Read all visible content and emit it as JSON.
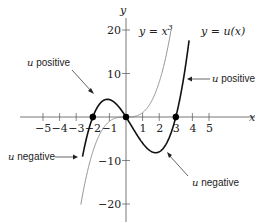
{
  "chart_data": {
    "type": "line",
    "title": "",
    "xlabel": "x",
    "ylabel": "y",
    "xlim": [
      -5.6,
      5.8
    ],
    "ylim": [
      -22,
      24
    ],
    "x_ticks": [
      -5,
      -4,
      -3,
      -2,
      -1,
      1,
      2,
      3,
      4,
      5
    ],
    "y_ticks": [
      20,
      10,
      -10,
      -20
    ],
    "x_tick_labels": [
      "−5",
      "−4",
      "−3",
      "−2",
      "−1",
      "1",
      "2",
      "3",
      "4",
      "5"
    ],
    "y_tick_labels": [
      "20",
      "10",
      "−10",
      "−20"
    ],
    "grid": false,
    "series": [
      {
        "name": "y = x^3",
        "label": "y = x³",
        "function": "x^3",
        "style": "thin gray",
        "x": [
          -2.8,
          -2,
          -1,
          0,
          1,
          2,
          2.8
        ],
        "values": [
          -21.95,
          -8,
          -1,
          0,
          1,
          8,
          21.95
        ]
      },
      {
        "name": "y = u(x)",
        "label": "y = u(x)",
        "function": "x(x+2)(x-3)",
        "style": "thick black",
        "x": [
          -2.5,
          -2,
          -1,
          0,
          1,
          2,
          3,
          3.5,
          4
        ],
        "values": [
          -6.875,
          0,
          4,
          0,
          -6,
          -8,
          0,
          9.625,
          24
        ]
      }
    ],
    "points": [
      {
        "x": -2,
        "y": 0
      },
      {
        "x": 0,
        "y": 0
      },
      {
        "x": 3,
        "y": 0
      }
    ],
    "annotations": [
      {
        "text": "u positive",
        "points_to": "hump between -2 and 0"
      },
      {
        "text": "u positive",
        "points_to": "curve right of x=3"
      },
      {
        "text": "u negative",
        "points_to": "curve left of x=-2"
      },
      {
        "text": "u negative",
        "points_to": "trough between 0 and 3"
      }
    ]
  },
  "labels": {
    "y_axis": "y",
    "x_axis": "x",
    "curve_cubic": "y = x",
    "curve_cubic_exp": "3",
    "curve_u": "y = u(x)",
    "u_var": "u",
    "positive": " positive",
    "negative": " negative"
  }
}
